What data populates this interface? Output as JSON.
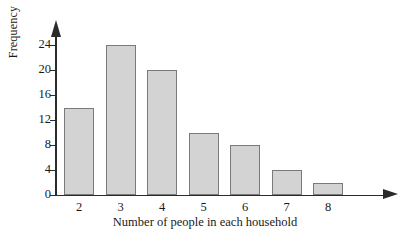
{
  "chart_data": {
    "type": "bar",
    "title": "",
    "xlabel": "Number of people in each household",
    "ylabel": "Frequency",
    "categories": [
      "2",
      "3",
      "4",
      "5",
      "6",
      "7",
      "8"
    ],
    "values": [
      14,
      24,
      20,
      10,
      8,
      4,
      2
    ],
    "ylim": [
      0,
      26
    ],
    "y_ticks": [
      "0",
      "4",
      "8",
      "12",
      "16",
      "20",
      "24"
    ],
    "y_tick_values": [
      0,
      4,
      8,
      12,
      16,
      20,
      24
    ],
    "grid": false,
    "legend": false,
    "bar_fill_color": "#d3d3d3",
    "bar_border_color": "#7a7a7a",
    "axis_color": "#2b2b2b",
    "background_color": "#ffffff"
  }
}
